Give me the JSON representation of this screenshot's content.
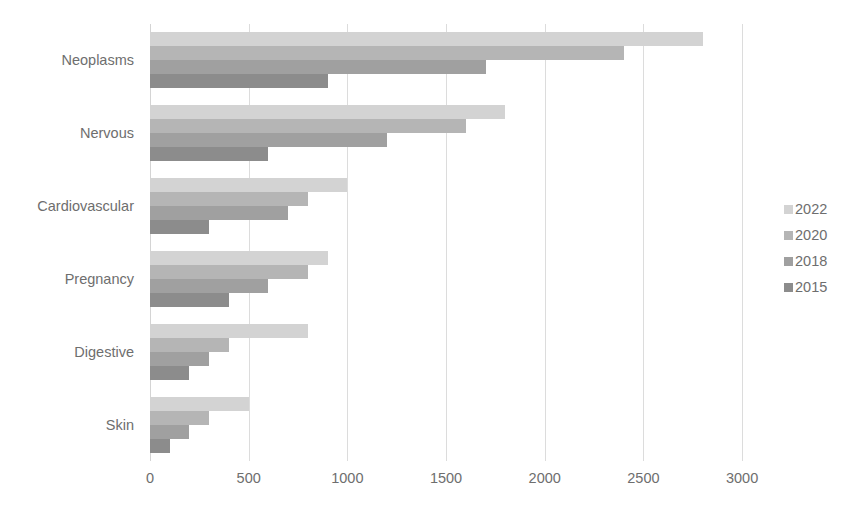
{
  "chart_data": {
    "type": "bar",
    "orientation": "horizontal",
    "title": "",
    "subtitle": "",
    "xlabel": "",
    "ylabel": "",
    "categories": [
      "Neoplasms",
      "Nervous",
      "Cardiovascular",
      "Pregnancy",
      "Digestive",
      "Skin"
    ],
    "series": [
      {
        "name": "2022",
        "color": "#d3d3d3",
        "values": [
          2800,
          1800,
          1000,
          900,
          800,
          500
        ]
      },
      {
        "name": "2020",
        "color": "#b5b5b5",
        "values": [
          2400,
          1600,
          800,
          800,
          400,
          300
        ]
      },
      {
        "name": "2018",
        "color": "#a0a0a0",
        "values": [
          1700,
          1200,
          700,
          600,
          300,
          200
        ]
      },
      {
        "name": "2015",
        "color": "#8c8c8c",
        "values": [
          900,
          600,
          300,
          400,
          200,
          100
        ]
      }
    ],
    "xticks": [
      0,
      500,
      1000,
      1500,
      2000,
      2500,
      3000
    ],
    "xtick_labels": [
      "0",
      "500",
      "1000",
      "1500",
      "2000",
      "2500",
      "3000"
    ],
    "xlim": [
      0,
      3050
    ],
    "grid": true,
    "grid_color": "#dcdcdc",
    "legend": {
      "position": "right",
      "entries": [
        {
          "label": "2022",
          "color": "#d3d3d3"
        },
        {
          "label": "2020",
          "color": "#b5b5b5"
        },
        {
          "label": "2018",
          "color": "#a0a0a0"
        },
        {
          "label": "2015",
          "color": "#8c8c8c"
        }
      ]
    },
    "style": {
      "background": "#ffffff",
      "tick_label_color": "#6e6e6e",
      "plot_left_px": 150,
      "plot_top_px": 24,
      "plot_width_px": 602,
      "plot_height_px": 437
    }
  }
}
